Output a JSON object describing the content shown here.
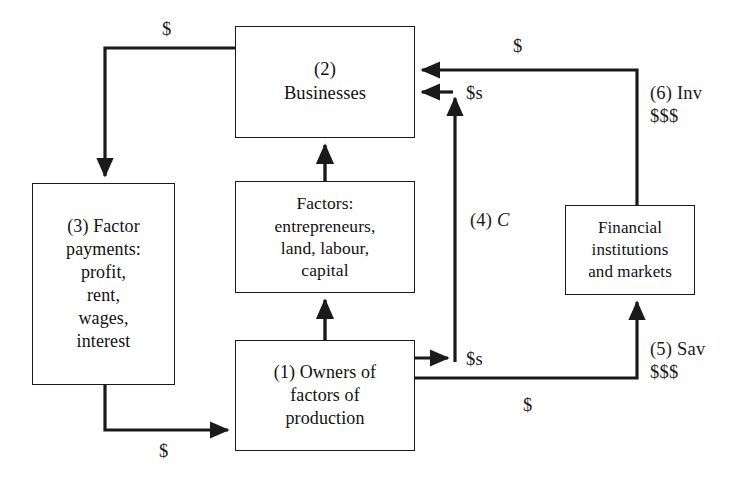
{
  "diagram": {
    "nodes": [
      {
        "id": "businesses",
        "label": "(2)\nBusinesses"
      },
      {
        "id": "factor-payments",
        "label": "(3) Factor\npayments:\nprofit,\nrent,\nwages,\ninterest"
      },
      {
        "id": "factors",
        "label": "Factors:\nentrepreneurs,\nland, labour,\ncapital"
      },
      {
        "id": "owners",
        "label": "(1) Owners of\nfactors of\nproduction"
      },
      {
        "id": "financial",
        "label": "Financial\ninstitutions\nand markets"
      }
    ],
    "edge_labels": {
      "businesses_to_factor_payments": "$",
      "factor_payments_to_owners": "$",
      "consumption_top": "$s",
      "consumption_mid": "(4) C",
      "consumption_mid_prefix": "(4)",
      "consumption_mid_symbol": "C",
      "owners_to_consumption": "$s",
      "owners_to_savings": "$",
      "investment_top": "$",
      "investment_side_line1": "(6) Inv",
      "investment_side_line2": "$$$",
      "savings_side_line1": "(5) Sav",
      "savings_side_line2": "$$$"
    },
    "colors": {
      "stroke": "#1a1a1a",
      "box_border": "#1a1a1a",
      "text": "#111111",
      "background": "#ffffff"
    }
  }
}
